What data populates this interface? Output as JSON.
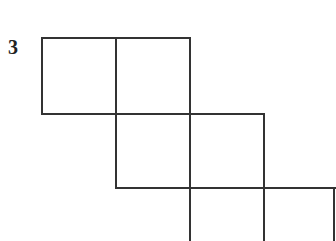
{
  "problem": {
    "number": "3"
  },
  "diagram": {
    "stroke_color": "#333333",
    "rows": [
      {
        "row": 1,
        "squares": 2
      },
      {
        "row": 2,
        "squares": 2
      },
      {
        "row": 3,
        "squares": 2
      }
    ]
  }
}
